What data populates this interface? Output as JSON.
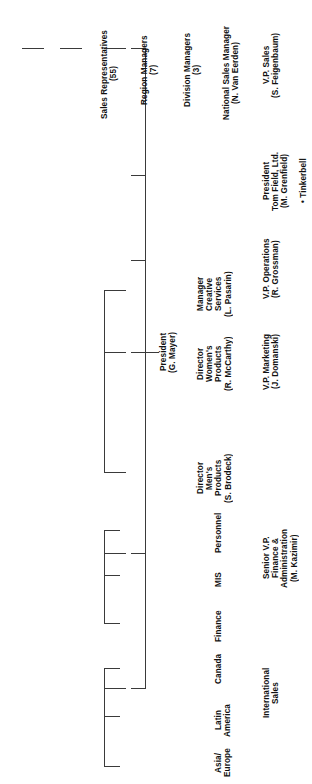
{
  "chart_title": "Organization Chart",
  "orientation": "rotated-90-ccw",
  "nodes": {
    "president": {
      "title": "President",
      "name": "(G. Mayer)"
    },
    "vp_sales": {
      "title": "V.P. Sales",
      "name": "(S. Feigenbaum)"
    },
    "national_sales_manager": {
      "title": "National Sales Manager",
      "name": "(N. Van Eerden)"
    },
    "division_managers": {
      "title": "Division Managers",
      "count": "(3)"
    },
    "region_managers": {
      "title": "Region Managers",
      "count": "(7)"
    },
    "sales_representatives": {
      "title": "Sales Representatives",
      "count": "(55)"
    },
    "tom_field": {
      "title": "President\nTom Field, Ltd.",
      "name": "(M. Grenfield)",
      "note": "• Tinkerbell"
    },
    "vp_operations": {
      "title": "V.P. Operations",
      "name": "(R. Grossman)"
    },
    "vp_marketing": {
      "title": "V.P. Marketing",
      "name": "(J. Domanski)"
    },
    "manager_creative": {
      "title": "Manager\nCreative\nServices",
      "name": "(L. Pasarin)"
    },
    "director_womens": {
      "title": "Director\nWomen's\nProducts",
      "name": "(R. McCarthy)"
    },
    "director_mens": {
      "title": "Director\nMen's\nProducts",
      "name": "(S. Brodeck)"
    },
    "senior_vp": {
      "title": "Senior V.P.\nFinance &\nAdministration",
      "name": "(M. Kazimir)"
    },
    "personnel": {
      "title": "Personnel"
    },
    "mis": {
      "title": "MIS"
    },
    "finance": {
      "title": "Finance"
    },
    "international_sales": {
      "title": "International\nSales"
    },
    "canada": {
      "title": "Canada"
    },
    "latin_america": {
      "title": "Latin\nAmerica"
    },
    "asia_europe": {
      "title": "Asia/\nEurope"
    }
  },
  "style": {
    "line_color": "#3a3a3a",
    "text_color": "#111111",
    "background": "#ffffff"
  }
}
